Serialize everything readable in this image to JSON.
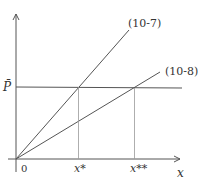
{
  "diagram": {
    "axes": {
      "x_label": "x",
      "origin_label": "0"
    },
    "price_line": {
      "label": "P̄"
    },
    "lines": [
      {
        "id": "eq-10-7",
        "label": "(10-7)"
      },
      {
        "id": "eq-10-8",
        "label": "(10-8)"
      }
    ],
    "x_marks": [
      {
        "label": "x*"
      },
      {
        "label": "x**"
      }
    ],
    "colors": {
      "line": "#555555",
      "guide": "#888888",
      "background": "#ffffff"
    }
  }
}
